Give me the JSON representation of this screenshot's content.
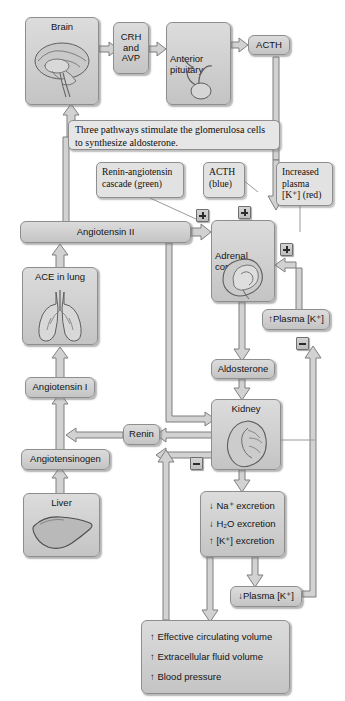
{
  "diagram": {
    "caption": "Three pathways stimulate the glomerulosa cells to synthesize aldosterone.",
    "colors": {
      "box_fill": "#cfcfcf",
      "box_border": "#8e8e8e",
      "callout_fill": "#e2e2e2",
      "arrow_fill": "#d2d2d2",
      "arrow_stroke": "#7a7a7a",
      "text": "#141414"
    },
    "nodes": {
      "brain": "Brain",
      "crh_avp": "CRH\nand\nAVP",
      "crh_line1": "CRH",
      "crh_line2": "and",
      "crh_line3": "AVP",
      "anterior_pituitary_line1": "Anterior",
      "anterior_pituitary_line2": "pituitary",
      "acth": "ACTH",
      "angiotensin_ii": "Angiotensin II",
      "ace_in_lung": "ACE in lung",
      "angiotensin_i": "Angiotensin I",
      "angiotensinogen": "Angiotensinogen",
      "liver": "Liver",
      "renin": "Renin",
      "adrenal_cortex_line1": "Adrenal",
      "adrenal_cortex_line2": "cortex",
      "aldosterone": "Aldosterone",
      "kidney": "Kidney",
      "plasma_k_up": "↑Plasma [K⁺]",
      "plasma_k_down": "↓Plasma [K⁺]"
    },
    "callouts": {
      "renin_angiotensin": "Renin-angiotensin cascade (green)",
      "acth_blue": "ACTH (blue)",
      "increased_plasma_k": "Increased plasma [K⁺] (red)"
    },
    "excretion": {
      "na": "↓ Na⁺ excretion",
      "h2o": "↓ H₂O excretion",
      "k": "↑ [K⁺] excretion"
    },
    "outcomes": {
      "ecv": "↑ Effective circulating volume",
      "ecf": "↑ Extracellular fluid volume",
      "bp": "↑ Blood pressure"
    },
    "signs": {
      "plus": "+",
      "minus": "−",
      "plus_angiotensin_label": "plus-sign-angiotensin",
      "plus_acth_label": "plus-sign-acth",
      "plus_potassium_label": "plus-sign-potassium",
      "minus_kidney_label": "minus-sign-kidney",
      "minus_plasma_label": "minus-sign-plasma"
    },
    "icons": {
      "brain": "brain-illustration",
      "pituitary": "pituitary-gland-illustration",
      "lungs": "lungs-illustration",
      "liver": "liver-illustration",
      "adrenal": "adrenal-cortex-illustration",
      "kidney": "kidney-illustration"
    }
  }
}
